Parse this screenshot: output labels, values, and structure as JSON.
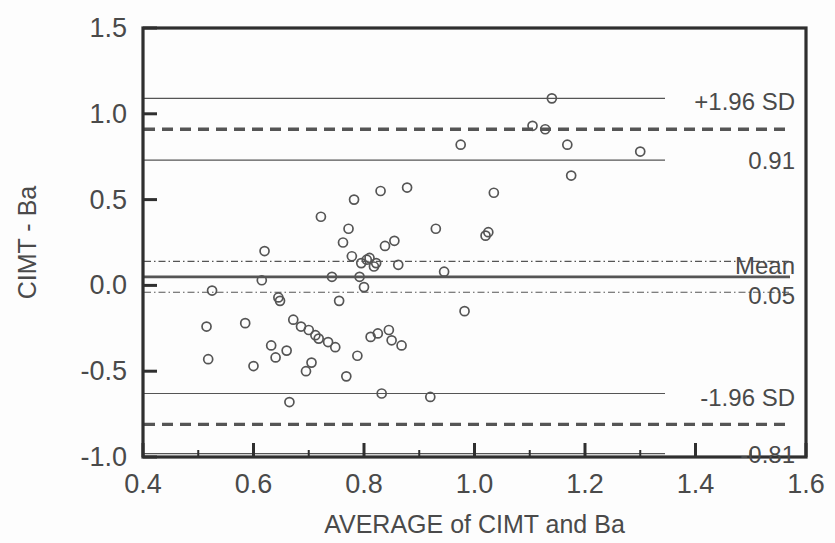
{
  "chart_data": {
    "type": "scatter",
    "title": "",
    "subtitle": "",
    "xlabel": "AVERAGE of CIMT and Ba",
    "ylabel": "CIMT - Ba",
    "xlim": [
      0.4,
      1.6
    ],
    "ylim": [
      -1.0,
      1.5
    ],
    "xticks": [
      0.4,
      0.6,
      0.8,
      1.0,
      1.2,
      1.4,
      1.6
    ],
    "xtick_labels": [
      "0.4",
      "0.6",
      "0.8",
      "1.0",
      "1.2",
      "1.4",
      "1.6"
    ],
    "xminor_step": 0.1,
    "yticks": [
      -1.0,
      -0.5,
      0.0,
      0.5,
      1.0,
      1.5
    ],
    "ytick_labels": [
      "-1.0",
      "-0.5",
      "0.0",
      "0.5",
      "1.0",
      "1.5"
    ],
    "grid": false,
    "legend": "none",
    "marker": "open-circle",
    "marker_size": 9,
    "points": [
      {
        "x": 0.515,
        "y": -0.24
      },
      {
        "x": 0.518,
        "y": -0.43
      },
      {
        "x": 0.525,
        "y": -0.03
      },
      {
        "x": 0.585,
        "y": -0.22
      },
      {
        "x": 0.6,
        "y": -0.47
      },
      {
        "x": 0.615,
        "y": 0.03
      },
      {
        "x": 0.62,
        "y": 0.2
      },
      {
        "x": 0.632,
        "y": -0.35
      },
      {
        "x": 0.64,
        "y": -0.42
      },
      {
        "x": 0.645,
        "y": -0.07
      },
      {
        "x": 0.648,
        "y": -0.09
      },
      {
        "x": 0.66,
        "y": -0.38
      },
      {
        "x": 0.665,
        "y": -0.68
      },
      {
        "x": 0.672,
        "y": -0.2
      },
      {
        "x": 0.686,
        "y": -0.24
      },
      {
        "x": 0.695,
        "y": -0.5
      },
      {
        "x": 0.7,
        "y": -0.26
      },
      {
        "x": 0.705,
        "y": -0.45
      },
      {
        "x": 0.712,
        "y": -0.29
      },
      {
        "x": 0.718,
        "y": -0.31
      },
      {
        "x": 0.722,
        "y": 0.4
      },
      {
        "x": 0.735,
        "y": -0.33
      },
      {
        "x": 0.742,
        "y": 0.05
      },
      {
        "x": 0.748,
        "y": -0.36
      },
      {
        "x": 0.755,
        "y": -0.09
      },
      {
        "x": 0.762,
        "y": 0.25
      },
      {
        "x": 0.768,
        "y": -0.53
      },
      {
        "x": 0.772,
        "y": 0.33
      },
      {
        "x": 0.778,
        "y": 0.17
      },
      {
        "x": 0.782,
        "y": 0.5
      },
      {
        "x": 0.788,
        "y": -0.41
      },
      {
        "x": 0.792,
        "y": 0.05
      },
      {
        "x": 0.795,
        "y": 0.13
      },
      {
        "x": 0.8,
        "y": -0.01
      },
      {
        "x": 0.805,
        "y": 0.15
      },
      {
        "x": 0.81,
        "y": 0.16
      },
      {
        "x": 0.812,
        "y": -0.3
      },
      {
        "x": 0.818,
        "y": 0.11
      },
      {
        "x": 0.822,
        "y": 0.13
      },
      {
        "x": 0.825,
        "y": -0.28
      },
      {
        "x": 0.83,
        "y": 0.55
      },
      {
        "x": 0.832,
        "y": -0.63
      },
      {
        "x": 0.838,
        "y": 0.23
      },
      {
        "x": 0.845,
        "y": -0.26
      },
      {
        "x": 0.85,
        "y": -0.32
      },
      {
        "x": 0.855,
        "y": 0.26
      },
      {
        "x": 0.862,
        "y": 0.12
      },
      {
        "x": 0.868,
        "y": -0.35
      },
      {
        "x": 0.878,
        "y": 0.57
      },
      {
        "x": 0.92,
        "y": -0.65
      },
      {
        "x": 0.93,
        "y": 0.33
      },
      {
        "x": 0.945,
        "y": 0.08
      },
      {
        "x": 0.975,
        "y": 0.82
      },
      {
        "x": 0.982,
        "y": -0.15
      },
      {
        "x": 1.02,
        "y": 0.29
      },
      {
        "x": 1.025,
        "y": 0.31
      },
      {
        "x": 1.035,
        "y": 0.54
      },
      {
        "x": 1.105,
        "y": 0.93
      },
      {
        "x": 1.128,
        "y": 0.91
      },
      {
        "x": 1.14,
        "y": 1.09
      },
      {
        "x": 1.168,
        "y": 0.82
      },
      {
        "x": 1.175,
        "y": 0.64
      },
      {
        "x": 1.3,
        "y": 0.78
      }
    ],
    "reference_lines": [
      {
        "name": "upper-ci-high",
        "y": 1.09,
        "style": "thin-solid",
        "label": ""
      },
      {
        "name": "upper-limit-of-agreement",
        "y": 0.91,
        "style": "dashed",
        "label": "+1.96 SD",
        "value_label": "0.91"
      },
      {
        "name": "upper-ci-low",
        "y": 0.73,
        "style": "thin-solid",
        "label": ""
      },
      {
        "name": "mean-ci-high",
        "y": 0.14,
        "style": "dash-dot",
        "label": ""
      },
      {
        "name": "mean-bias",
        "y": 0.05,
        "style": "thick-solid",
        "label": "Mean",
        "value_label": "0.05"
      },
      {
        "name": "mean-ci-low",
        "y": -0.04,
        "style": "dash-dot",
        "label": ""
      },
      {
        "name": "lower-ci-high",
        "y": -0.63,
        "style": "thin-solid",
        "label": ""
      },
      {
        "name": "lower-limit-of-agreement",
        "y": -0.81,
        "style": "dashed",
        "label": "-1.96 SD",
        "value_label": "-0.81"
      },
      {
        "name": "lower-ci-low",
        "y": -0.98,
        "style": "thin-solid",
        "label": ""
      }
    ]
  },
  "annotations": {
    "upper_sd_label": "+1.96 SD",
    "upper_sd_value": "0.91",
    "mean_label": "Mean",
    "mean_value": "0.05",
    "lower_sd_label": "-1.96 SD",
    "lower_sd_value": "-0.81"
  },
  "colors": {
    "frame": "#2f2f2f",
    "marker_stroke": "#555555",
    "line": "#555555",
    "text": "#4a4a4a",
    "background": "#fdfdfd"
  }
}
